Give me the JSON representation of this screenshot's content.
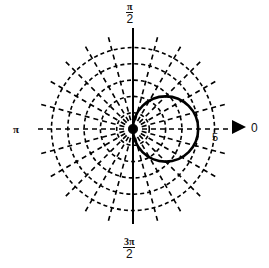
{
  "chart_data": {
    "type": "polar",
    "title": "",
    "equation": "r = 4cos(θ)",
    "series": [
      {
        "name": "r = 4cos θ",
        "style": "solid",
        "color": "#000000",
        "points": [
          {
            "theta_deg": 0,
            "r": 4.0
          },
          {
            "theta_deg": 15,
            "r": 3.86
          },
          {
            "theta_deg": 30,
            "r": 3.46
          },
          {
            "theta_deg": 45,
            "r": 2.83
          },
          {
            "theta_deg": 60,
            "r": 2.0
          },
          {
            "theta_deg": 75,
            "r": 1.04
          },
          {
            "theta_deg": 90,
            "r": 0.0
          },
          {
            "theta_deg": -15,
            "r": 3.86
          },
          {
            "theta_deg": -30,
            "r": 3.46
          },
          {
            "theta_deg": -45,
            "r": 2.83
          },
          {
            "theta_deg": -60,
            "r": 2.0
          },
          {
            "theta_deg": -75,
            "r": 1.04
          }
        ]
      }
    ],
    "radial_axis": {
      "rings": [
        1,
        2,
        3,
        4,
        5
      ],
      "max": 5,
      "ring_style": "dashed",
      "tick_labels": [
        "5"
      ]
    },
    "angular_axis": {
      "spoke_interval_deg": 15,
      "spoke_style": "dashed",
      "labels": [
        {
          "angle": "0",
          "text": "0"
        },
        {
          "angle": "π/2",
          "numerator": "π",
          "denominator": "2"
        },
        {
          "angle": "π",
          "text": "π"
        },
        {
          "angle": "3π/2",
          "numerator": "3π",
          "denominator": "2"
        }
      ]
    },
    "vertical_axis_solid": true,
    "grid": true,
    "legend": null
  },
  "labels": {
    "top_num": "π",
    "top_den": "2",
    "bottom_num": "3π",
    "bottom_den": "2",
    "left": "π",
    "right": "0",
    "ring_max": "5"
  },
  "colors": {
    "ink": "#000000",
    "background": "#ffffff"
  }
}
